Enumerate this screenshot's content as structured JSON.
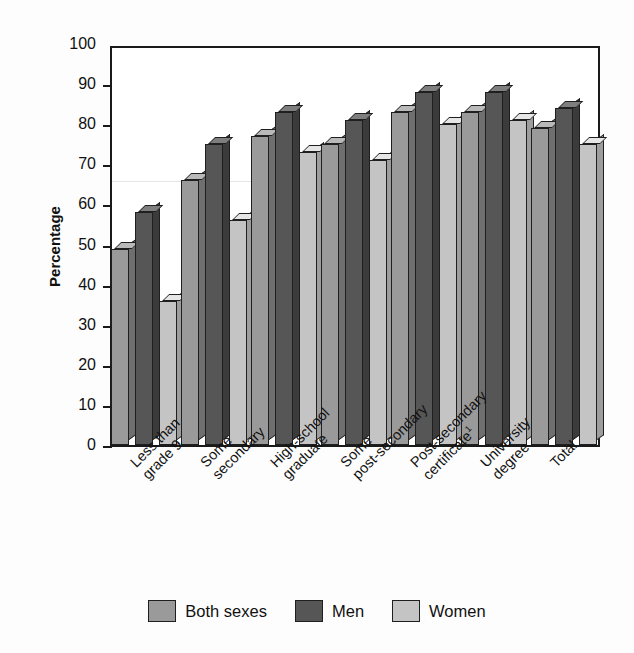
{
  "chart_data": {
    "type": "bar",
    "title": "",
    "xlabel": "",
    "ylabel": "Percentage",
    "ylim": [
      0,
      100
    ],
    "yticks": [
      0,
      10,
      20,
      30,
      40,
      50,
      60,
      70,
      80,
      90,
      100
    ],
    "grid": false,
    "legend_position": "bottom",
    "categories": [
      "Less than\ngrade 9",
      "Some\nsecondary",
      "High-school\ngraduate",
      "Some\npost-secondary",
      "Post-secondary\ncertificate",
      "University\ndegree",
      "Total"
    ],
    "category_footnotes": [
      "",
      "",
      "",
      "",
      "1",
      "",
      ""
    ],
    "series": [
      {
        "name": "Both sexes",
        "color": "#9a9a9a",
        "values": [
          49,
          66,
          77,
          75,
          83,
          83,
          79
        ]
      },
      {
        "name": "Men",
        "color": "#565656",
        "values": [
          58,
          75,
          83,
          81,
          88,
          88,
          84
        ]
      },
      {
        "name": "Women",
        "color": "#c4c4c4",
        "values": [
          36,
          56,
          73,
          71,
          80,
          81,
          75
        ]
      }
    ]
  },
  "axis": {
    "y_title": "Percentage",
    "tick_labels": [
      "100",
      "90",
      "80",
      "70",
      "60",
      "50",
      "40",
      "30",
      "20",
      "10",
      "0"
    ]
  },
  "legend": {
    "items": [
      {
        "label": "Both sexes",
        "swatch": "s0"
      },
      {
        "label": "Men",
        "swatch": "s1"
      },
      {
        "label": "Women",
        "swatch": "s2"
      }
    ]
  }
}
